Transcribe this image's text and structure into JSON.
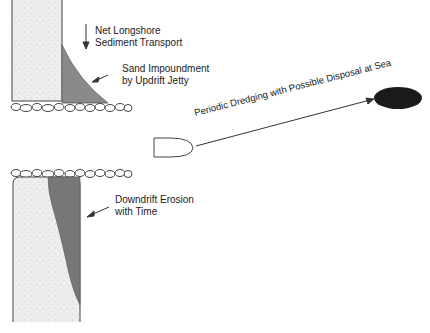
{
  "diagram": {
    "labels": {
      "longshore_line1": "Net Longshore",
      "longshore_line2": "Sediment Transport",
      "impound_line1": "Sand Impoundment",
      "impound_line2": "by Updrift Jetty",
      "dredging": "Periodic Dredging with Possible Disposal at Sea",
      "erosion_line1": "Downdrift Erosion",
      "erosion_line2": "with Time"
    },
    "colors": {
      "beach_sand": "#ececec",
      "impoundment": "#8a8a8a",
      "erosion": "#777777",
      "disposal_site": "#1a1a1a",
      "line": "#333333"
    }
  }
}
